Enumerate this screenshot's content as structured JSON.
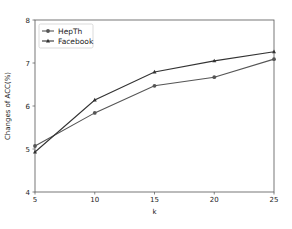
{
  "chart_data": {
    "type": "line",
    "title": "",
    "xlabel": "k",
    "ylabel": "Changes of ACC(%)",
    "x": [
      5,
      10,
      15,
      20,
      25
    ],
    "xlim": [
      5,
      25
    ],
    "ylim": [
      4,
      8
    ],
    "xticks": [
      "5",
      "10",
      "15",
      "20",
      "25"
    ],
    "yticks": [
      "4",
      "5",
      "6",
      "7",
      "8"
    ],
    "grid": false,
    "legend_position": "upper left",
    "series": [
      {
        "name": "HepTh",
        "marker": "circle",
        "color": "#555555",
        "values": [
          5.07,
          5.84,
          6.47,
          6.67,
          7.09
        ]
      },
      {
        "name": "Facebook",
        "marker": "triangle",
        "color": "#333333",
        "values": [
          4.93,
          6.14,
          6.79,
          7.05,
          7.26
        ]
      }
    ]
  }
}
